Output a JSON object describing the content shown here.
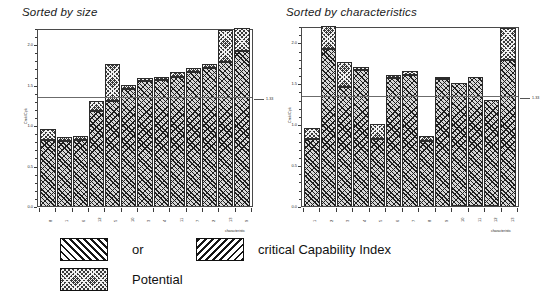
{
  "chart_data": [
    {
      "type": "bar",
      "id": "sorted-by-size",
      "title": "Sorted by size",
      "xlabel": "characteristic",
      "ylabel": "Cmk/Cpk",
      "ylim": [
        0.0,
        2.2
      ],
      "yticks": [
        "0.0",
        "0.5",
        "1.0",
        "1.5",
        "2.0"
      ],
      "ytick_values": [
        0.0,
        0.5,
        1.0,
        1.5,
        2.0
      ],
      "grid": false,
      "stacked": true,
      "legend_position": "below",
      "reference_line": {
        "value": 1.33,
        "label": "1.33"
      },
      "categories": [
        "8",
        "1",
        "6",
        "12",
        "5",
        "10",
        "3",
        "4",
        "11",
        "7",
        "2",
        "13",
        "9"
      ],
      "series": [
        {
          "name": "critical Capability Index",
          "values": [
            0.82,
            0.8,
            0.82,
            1.18,
            1.3,
            1.45,
            1.55,
            1.56,
            1.6,
            1.66,
            1.7,
            1.78,
            1.92
          ]
        },
        {
          "name": "Potential",
          "values": [
            0.13,
            0.05,
            0.05,
            0.12,
            0.45,
            0.04,
            0.03,
            0.04,
            0.06,
            0.05,
            0.06,
            0.4,
            0.28
          ]
        }
      ],
      "totals": [
        0.95,
        0.85,
        0.87,
        1.3,
        1.75,
        1.49,
        1.58,
        1.6,
        1.66,
        1.71,
        1.76,
        2.18,
        2.2
      ]
    },
    {
      "type": "bar",
      "id": "sorted-by-characteristics",
      "title": "Sorted by characteristics",
      "xlabel": "characteristic",
      "ylabel": "Cmk/Cpk",
      "ylim": [
        0.0,
        2.2
      ],
      "yticks": [
        "0.0",
        "0.5",
        "1.0",
        "1.5",
        "2.0"
      ],
      "ytick_values": [
        0.0,
        0.5,
        1.0,
        1.5,
        2.0
      ],
      "grid": false,
      "stacked": true,
      "legend_position": "below",
      "reference_line": {
        "value": 1.33,
        "label": "1.33"
      },
      "categories": [
        "1",
        "2",
        "3",
        "4",
        "5",
        "6",
        "7",
        "8",
        "9",
        "10",
        "11",
        "12",
        "13"
      ],
      "series": [
        {
          "name": "critical Capability Index",
          "values": [
            0.82,
            1.92,
            1.45,
            1.66,
            0.82,
            1.56,
            1.6,
            0.8,
            1.55,
            1.5,
            1.58,
            1.3,
            1.78
          ]
        },
        {
          "name": "Potential",
          "values": [
            0.13,
            0.28,
            0.31,
            0.04,
            0.18,
            0.04,
            0.05,
            0.05,
            0.03,
            0.0,
            0.0,
            0.0,
            0.4
          ]
        }
      ],
      "totals": [
        0.95,
        2.2,
        1.76,
        1.7,
        1.0,
        1.6,
        1.65,
        0.85,
        1.58,
        1.5,
        1.58,
        1.3,
        2.18
      ]
    }
  ],
  "legend": {
    "items": [
      {
        "key": "or",
        "label": "or",
        "pattern": "diagonal-up-hatch"
      },
      {
        "key": "crit",
        "label": "critical Capability Index",
        "pattern": "diagonal-down-hatch"
      },
      {
        "key": "pot",
        "label": "Potential",
        "pattern": "cross-hatch"
      }
    ]
  },
  "colors": {
    "ink": "#111111",
    "axis": "#3a3a3a",
    "frame": "#4a4a4a",
    "refline": "#6b6b6b",
    "index_fill": "#d8d8d8",
    "potential_fill": "#3a3a3a",
    "background": "#ffffff"
  }
}
